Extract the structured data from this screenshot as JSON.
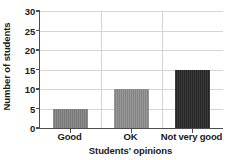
{
  "chart_data": {
    "type": "bar",
    "title": "",
    "subtitle": "",
    "categories": [
      "Good",
      "OK",
      "Not very good"
    ],
    "values": [
      5,
      10,
      15
    ],
    "series": [
      {
        "name": "Number of students",
        "values": [
          5,
          10,
          15
        ]
      }
    ],
    "xlabel": "Students' opinions",
    "ylabel": "Number of students",
    "ylim": [
      0,
      30
    ],
    "yticks": [
      0,
      5,
      10,
      15,
      20,
      25,
      30
    ],
    "ytick_labels": [
      "0",
      "5",
      "10",
      "15",
      "20",
      "25",
      "30"
    ],
    "xtick_labels": [
      "Good",
      "OK",
      "Not very good"
    ],
    "grid": "horizontal-and-vertical",
    "legend": "none",
    "bar_colors": [
      "#808080",
      "#8c8c8c",
      "#262626"
    ],
    "axis_color": "#4d4d4d",
    "gridline_color": "#d5d5d5",
    "background_color": "#ffffff",
    "text_color": "#1a1a1a",
    "annotations": []
  }
}
